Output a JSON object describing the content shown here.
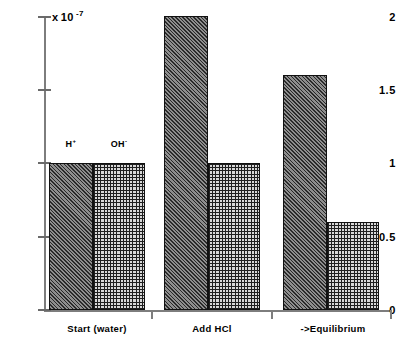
{
  "chart_data": {
    "type": "bar",
    "title": "",
    "subtitle": "",
    "xlabel": "",
    "ylabel": "",
    "multiplier": {
      "times": "x",
      "base": "10",
      "exponent": "-7",
      "full": "x 10-7"
    },
    "categories": [
      "Start  (water)",
      "Add HCl",
      "->Equilibrium"
    ],
    "series": [
      {
        "name": "H",
        "charge": "+",
        "pattern": "diagonal-hatch",
        "values": [
          1.0,
          2.0,
          1.6
        ]
      },
      {
        "name": "OH",
        "charge": "-",
        "pattern": "cross-hatch-grid",
        "values": [
          1.0,
          1.0,
          0.6
        ]
      }
    ],
    "ylim": [
      0,
      2
    ],
    "yticks": [
      0,
      0.5,
      1,
      1.5,
      2
    ],
    "ytick_labels": [
      "0",
      "0.5",
      "1",
      "1.5",
      "2"
    ],
    "grid": false,
    "legend": "inline-annotation",
    "annotations": [
      {
        "text": "H",
        "charge": "+",
        "for_series": "H",
        "at_category": "Start  (water)"
      },
      {
        "text": "OH",
        "charge": "-",
        "for_series": "OH",
        "at_category": "Start  (water)"
      }
    ],
    "colors": {
      "axis": "#7d7d7d",
      "bar_outline": "#111111",
      "text": "#000000",
      "background": "#ffffff"
    }
  }
}
